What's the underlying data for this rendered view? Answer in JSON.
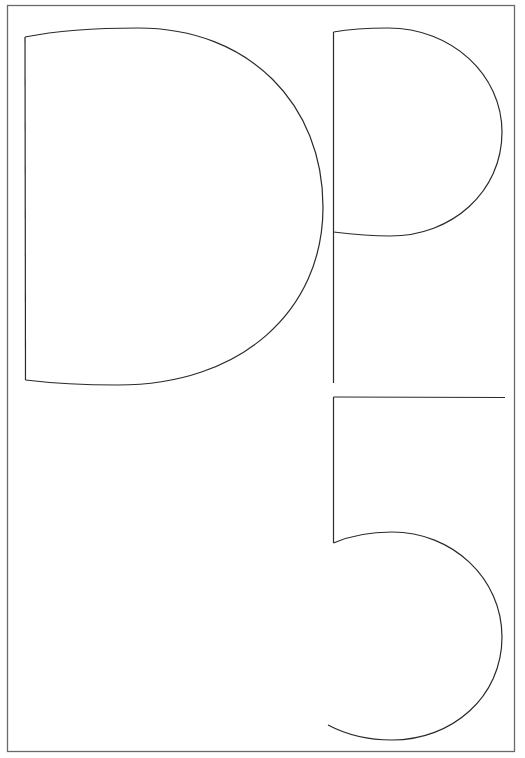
{
  "artwork": {
    "letters": [
      "D",
      "P",
      "5"
    ],
    "text": "DP5",
    "colors": {
      "background": "#ffffff",
      "frame": "#6a6a6a",
      "stroke": "#2a2a2a"
    }
  }
}
